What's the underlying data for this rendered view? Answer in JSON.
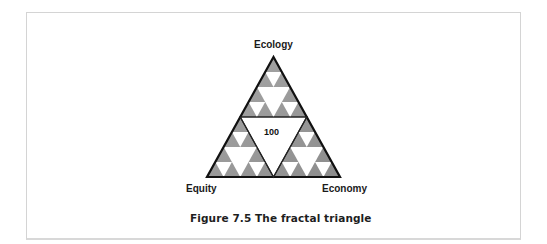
{
  "figure": {
    "vertices": {
      "top": "Ecology",
      "bottom_left": "Equity",
      "bottom_right": "Economy"
    },
    "center_value": "100",
    "caption": "Figure 7.5 The fractal triangle"
  },
  "colors": {
    "outline": "#111111",
    "fill_gray": "#9a9a9a",
    "fill_gray_dark": "#8a8a8a",
    "hole_white": "#ffffff",
    "frame_border": "#d4d4d4"
  }
}
